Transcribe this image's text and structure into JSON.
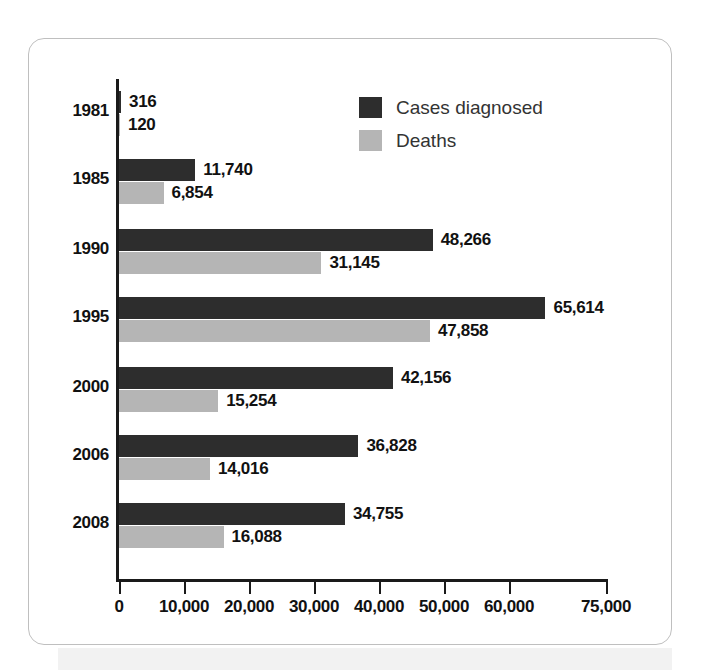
{
  "chart_data": {
    "type": "bar",
    "orientation": "horizontal",
    "title": "",
    "xlabel": "",
    "ylabel": "",
    "categories": [
      "1981",
      "1985",
      "1990",
      "1995",
      "2000",
      "2006",
      "2008"
    ],
    "series": [
      {
        "name": "Cases diagnosed",
        "color": "#2d2d2d",
        "values": [
          316,
          11740,
          48266,
          65614,
          42156,
          36828,
          34755
        ],
        "labels": [
          "316",
          "11,740",
          "48,266",
          "65,614",
          "42,156",
          "36,828",
          "34,755"
        ]
      },
      {
        "name": "Deaths",
        "color": "#b5b5b5",
        "values": [
          120,
          6854,
          31145,
          47858,
          15254,
          14016,
          16088
        ],
        "labels": [
          "120",
          "6,854",
          "31,145",
          "47,858",
          "15,254",
          "14,016",
          "16,088"
        ]
      }
    ],
    "xlim": [
      0,
      75000
    ],
    "xticks": [
      0,
      10000,
      20000,
      30000,
      40000,
      50000,
      60000,
      75000
    ],
    "xticklabels": [
      "0",
      "10,000",
      "20,000",
      "30,000",
      "40,000",
      "50,000",
      "60,000",
      "75,000"
    ],
    "grid": false,
    "legend_position": "top-center"
  },
  "legend": {
    "items": [
      {
        "label": "Cases diagnosed",
        "color": "#2d2d2d"
      },
      {
        "label": "Deaths",
        "color": "#b5b5b5"
      }
    ]
  }
}
